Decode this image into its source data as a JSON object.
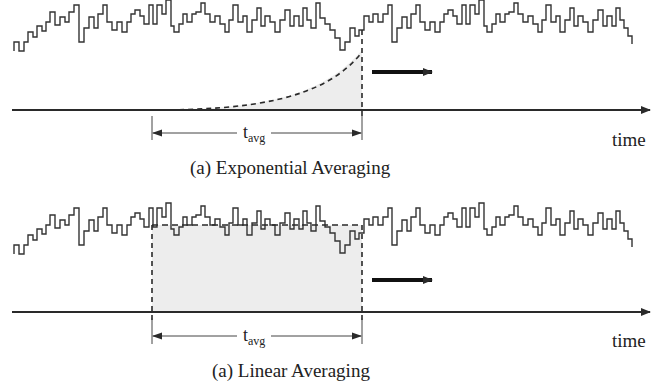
{
  "figure": {
    "panels": [
      {
        "id": "exponential",
        "caption": "(a) Exponential Averaging",
        "axis_label": "time",
        "window_label_main": "t",
        "window_label_sub": "avg",
        "window_start_x": 152,
        "window_end_x": 362,
        "weighting": "exponential",
        "arrow_direction": "right"
      },
      {
        "id": "linear",
        "caption": "(a) Linear Averaging",
        "axis_label": "time",
        "window_label_main": "t",
        "window_label_sub": "avg",
        "window_start_x": 152,
        "window_end_x": 362,
        "weighting": "uniform",
        "arrow_direction": "right"
      }
    ],
    "colors": {
      "line": "#2a2a2a",
      "shade": "#ececec",
      "background": "#ffffff"
    }
  }
}
